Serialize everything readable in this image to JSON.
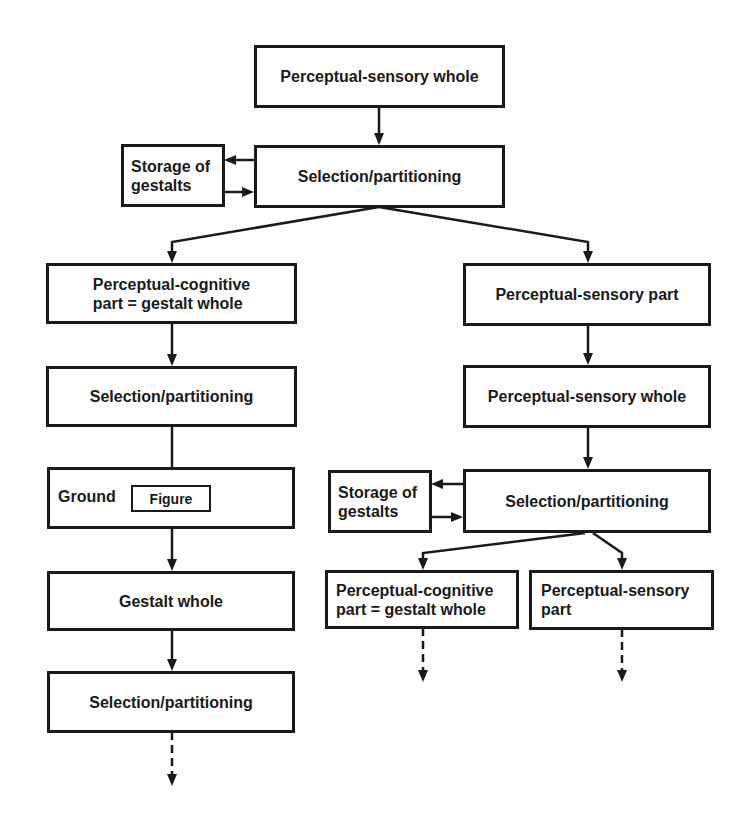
{
  "diagram": {
    "nodes": {
      "top_whole": "Perceptual-sensory whole",
      "top_selection": "Selection/partitioning",
      "top_storage_line1": "Storage of",
      "top_storage_line2": "gestalts",
      "left_cog_part_line1": "Perceptual-cognitive",
      "left_cog_part_line2": "part = gestalt whole",
      "left_selection": "Selection/partitioning",
      "left_ground": "Ground",
      "left_figure": "Figure",
      "left_gestalt_whole": "Gestalt whole",
      "left_selection_2": "Selection/partitioning",
      "right_sensory_part": "Perceptual-sensory part",
      "right_sensory_whole": "Perceptual-sensory whole",
      "right_storage_line1": "Storage of",
      "right_storage_line2": "gestalts",
      "right_selection": "Selection/partitioning",
      "right_cog_part_line1": "Perceptual-cognitive",
      "right_cog_part_line2": "part = gestalt whole",
      "right_sensory_part_2_line1": "Perceptual-sensory",
      "right_sensory_part_2_line2": "part"
    },
    "edges": [
      {
        "from": "top_whole",
        "to": "top_selection",
        "style": "solid"
      },
      {
        "from": "top_selection",
        "to": "top_storage",
        "style": "solid"
      },
      {
        "from": "top_storage",
        "to": "top_selection",
        "style": "solid"
      },
      {
        "from": "top_selection",
        "to": "left_cog_part",
        "style": "solid"
      },
      {
        "from": "top_selection",
        "to": "right_sensory_part",
        "style": "solid"
      },
      {
        "from": "left_cog_part",
        "to": "left_selection",
        "style": "solid"
      },
      {
        "from": "left_selection",
        "to": "left_figure",
        "style": "solid"
      },
      {
        "from": "left_figure",
        "to": "left_gestalt_whole",
        "style": "solid"
      },
      {
        "from": "left_gestalt_whole",
        "to": "left_selection_2",
        "style": "solid"
      },
      {
        "from": "left_selection_2",
        "to": "continuation",
        "style": "dashed"
      },
      {
        "from": "right_sensory_part",
        "to": "right_sensory_whole",
        "style": "solid"
      },
      {
        "from": "right_sensory_whole",
        "to": "right_selection",
        "style": "solid"
      },
      {
        "from": "right_selection",
        "to": "right_storage",
        "style": "solid"
      },
      {
        "from": "right_storage",
        "to": "right_selection",
        "style": "solid"
      },
      {
        "from": "right_selection",
        "to": "right_cog_part",
        "style": "solid"
      },
      {
        "from": "right_selection",
        "to": "right_sensory_part_2",
        "style": "solid"
      },
      {
        "from": "right_cog_part",
        "to": "continuation",
        "style": "dashed"
      },
      {
        "from": "right_sensory_part_2",
        "to": "continuation",
        "style": "dashed"
      }
    ],
    "colors": {
      "line": "#1a1a1a",
      "background": "#ffffff"
    }
  }
}
